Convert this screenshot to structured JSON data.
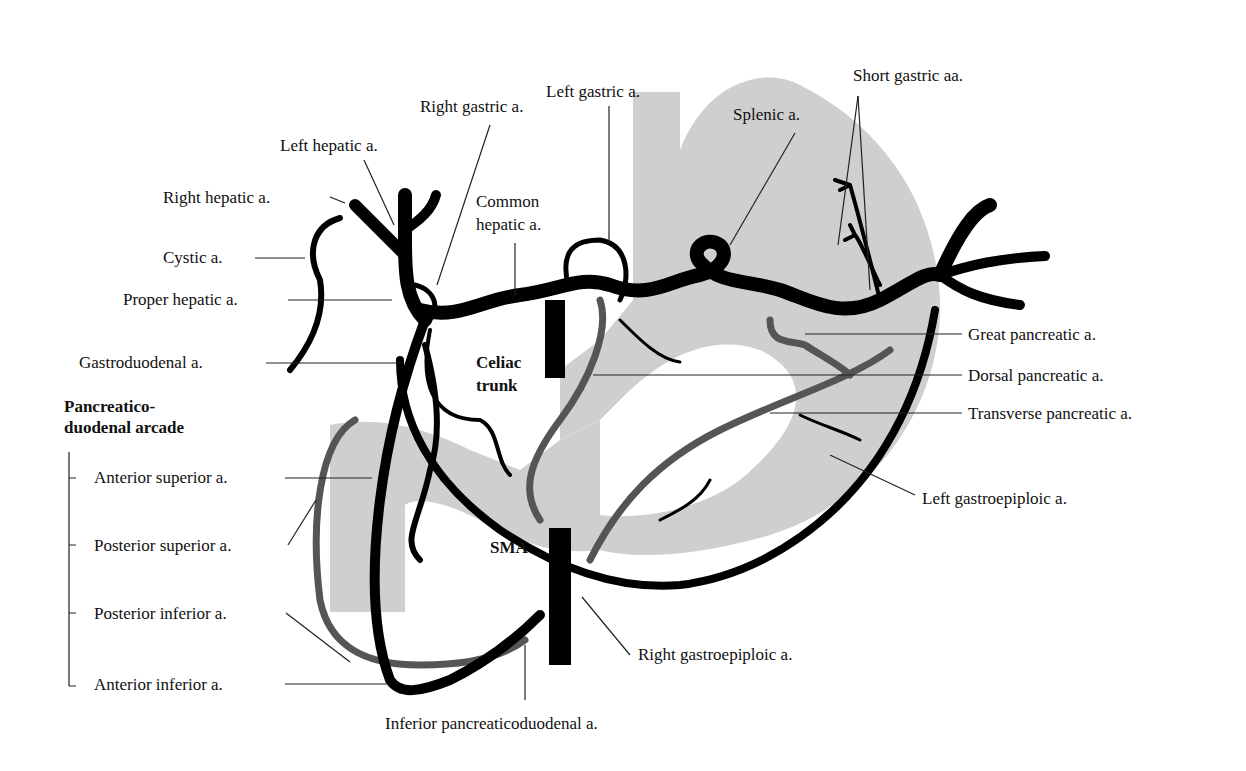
{
  "diagram": {
    "colors": {
      "background": "#ffffff",
      "organ_fill": "#cfcfcf",
      "artery": "#000000",
      "posterior_artery": "#555555",
      "leader_line": "#222222"
    },
    "labels": {
      "left_gastric": "Left gastric a.",
      "short_gastric": "Short gastric aa.",
      "right_gastric": "Right gastric a.",
      "splenic": "Splenic a.",
      "left_hepatic": "Left hepatic a.",
      "right_hepatic": "Right hepatic a.",
      "common_hepatic_1": "Common",
      "common_hepatic_2": "hepatic a.",
      "cystic": "Cystic a.",
      "proper_hepatic": "Proper hepatic a.",
      "great_pancreatic": "Great pancreatic a.",
      "gastroduodenal": "Gastroduodenal a.",
      "celiac_1": "Celiac",
      "celiac_2": "trunk",
      "dorsal_pancreatic": "Dorsal pancreatic a.",
      "transverse_pancreatic": "Transverse pancreatic a.",
      "left_gastroepiploic": "Left gastroepiploic a.",
      "sma": "SMA",
      "right_gastroepiploic": "Right gastroepiploic a.",
      "inferior_pancreaticoduodenal": "Inferior pancreaticoduodenal a."
    },
    "arcade": {
      "heading_1": "Pancreatico-",
      "heading_2": "duodenal arcade",
      "items": [
        "Anterior superior a.",
        "Posterior superior a.",
        "Posterior inferior a.",
        "Anterior inferior a."
      ]
    }
  }
}
